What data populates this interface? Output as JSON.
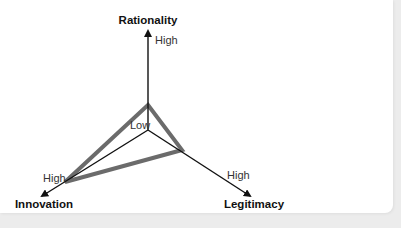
{
  "diagram": {
    "type": "radar-triangle",
    "axes": [
      {
        "name": "Rationality",
        "high_label": "High"
      },
      {
        "name": "Innovation",
        "high_label": "High"
      },
      {
        "name": "Legitimacy",
        "high_label": "High"
      }
    ],
    "center_label": "Low",
    "profile_color": "#6b6b6b",
    "axis_color": "#111111"
  }
}
